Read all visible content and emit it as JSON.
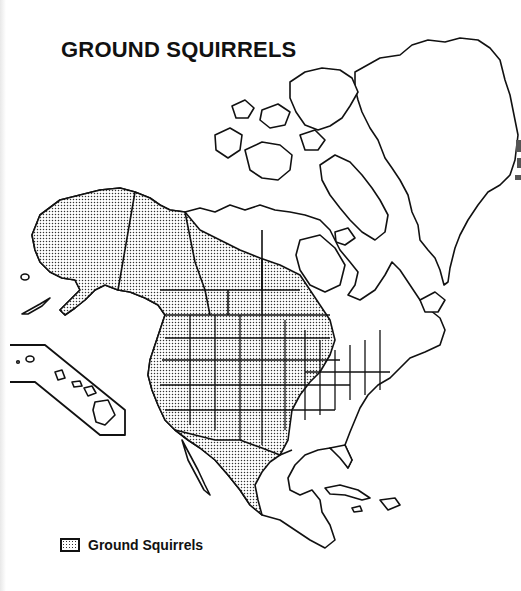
{
  "map": {
    "title": "GROUND SQUIRRELS",
    "region": "North America",
    "shaded_areas": [
      "Alaska",
      "Yukon",
      "Southwestern Northwest Territories",
      "British Columbia",
      "Alberta",
      "Saskatchewan",
      "Manitoba (southern)",
      "Western and central United States",
      "Northern and central Mexico"
    ],
    "unshaded_areas": [
      "Arctic Archipelago",
      "Greenland",
      "Eastern Canada",
      "Southeastern United States",
      "Northeastern United States",
      "Southern Mexico",
      "Central America",
      "Caribbean",
      "Hawaii (inset)"
    ],
    "inset": "Hawaii",
    "colors": {
      "outline": "#111111",
      "fill_pattern": "#333333",
      "background": "#ffffff"
    }
  },
  "legend": {
    "items": [
      {
        "label": "Ground Squirrels",
        "pattern": "stipple"
      }
    ]
  }
}
